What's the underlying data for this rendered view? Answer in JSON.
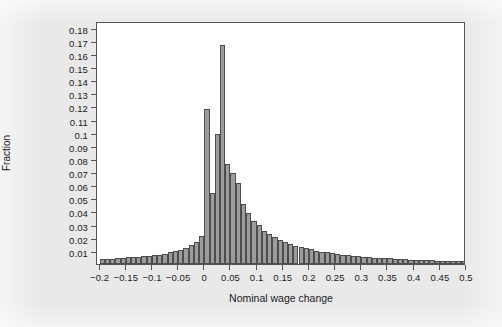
{
  "figure": {
    "background_color": "#e9e9e9",
    "plot_background_color": "#ffffff",
    "frame_color": "#565656",
    "bar_fill_color": "#9c9c9c",
    "bar_edge_color": "#4d4d4d"
  },
  "chart_data": {
    "type": "bar",
    "chart_subtype": "histogram",
    "title": "",
    "xlabel": "Nominal wage change",
    "ylabel": "Fraction",
    "xlim": [
      -0.205,
      0.5
    ],
    "ylim": [
      0,
      0.185
    ],
    "grid": false,
    "legend": null,
    "bin_width": 0.01,
    "xticks": [
      -0.2,
      -0.15,
      -0.1,
      -0.05,
      0,
      0.05,
      0.1,
      0.15,
      0.2,
      0.25,
      0.3,
      0.35,
      0.4,
      0.45,
      0.5
    ],
    "xtick_labels": [
      "-0.2",
      "-0.15",
      "-0.1",
      "-0.05",
      "0",
      "0.05",
      "0.1",
      "0.15",
      "0.2",
      "0.25",
      "0.3",
      "0.35",
      "0.4",
      "0.45",
      "0.5"
    ],
    "yticks": [
      0.01,
      0.02,
      0.03,
      0.04,
      0.05,
      0.06,
      0.07,
      0.08,
      0.09,
      0.1,
      0.11,
      0.12,
      0.13,
      0.14,
      0.15,
      0.16,
      0.17,
      0.18
    ],
    "ytick_labels": [
      "0.01",
      "0.02",
      "0.03",
      "0.04",
      "0.05",
      "0.06",
      "0.07",
      "0.08",
      "0.09",
      "0.1",
      "0.11",
      "0.12",
      "0.13",
      "0.14",
      "0.15",
      "0.16",
      "0.17",
      "0.18"
    ],
    "bin_left_edges": [
      -0.2,
      -0.19,
      -0.18,
      -0.17,
      -0.16,
      -0.15,
      -0.14,
      -0.13,
      -0.12,
      -0.11,
      -0.1,
      -0.09,
      -0.08,
      -0.07,
      -0.06,
      -0.05,
      -0.04,
      -0.03,
      -0.02,
      -0.01,
      0.0,
      0.01,
      0.02,
      0.03,
      0.04,
      0.05,
      0.06,
      0.07,
      0.08,
      0.09,
      0.1,
      0.11,
      0.12,
      0.13,
      0.14,
      0.15,
      0.16,
      0.17,
      0.18,
      0.19,
      0.2,
      0.21,
      0.22,
      0.23,
      0.24,
      0.25,
      0.26,
      0.27,
      0.28,
      0.29,
      0.3,
      0.31,
      0.32,
      0.33,
      0.34,
      0.35,
      0.36,
      0.37,
      0.38,
      0.39,
      0.4,
      0.41,
      0.42,
      0.43,
      0.44,
      0.45,
      0.46,
      0.47,
      0.48,
      0.49
    ],
    "values": [
      0.0035,
      0.0038,
      0.004,
      0.0042,
      0.0048,
      0.0052,
      0.005,
      0.0055,
      0.0058,
      0.0062,
      0.0068,
      0.0072,
      0.008,
      0.0088,
      0.0098,
      0.011,
      0.0125,
      0.0145,
      0.017,
      0.0215,
      0.118,
      0.054,
      0.099,
      0.167,
      0.076,
      0.069,
      0.062,
      0.0455,
      0.039,
      0.033,
      0.03,
      0.0255,
      0.0225,
      0.0205,
      0.0185,
      0.0165,
      0.0155,
      0.014,
      0.013,
      0.012,
      0.0118,
      0.0098,
      0.0092,
      0.0088,
      0.0082,
      0.0078,
      0.0072,
      0.0066,
      0.0062,
      0.0058,
      0.0055,
      0.005,
      0.0048,
      0.0046,
      0.0044,
      0.0042,
      0.004,
      0.0038,
      0.0036,
      0.0034,
      0.0032,
      0.003,
      0.0029,
      0.0028,
      0.0026,
      0.0025,
      0.0024,
      0.0022,
      0.0021,
      0.002
    ]
  }
}
